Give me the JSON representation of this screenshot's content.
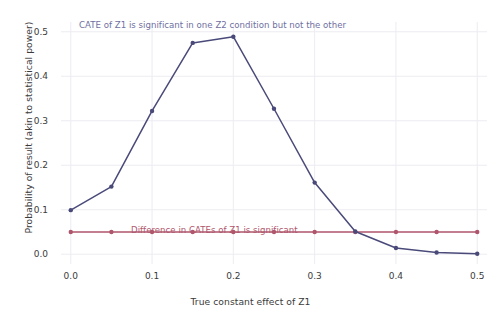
{
  "chart_data": {
    "type": "line",
    "title": "",
    "subtitle": "",
    "xlabel": "True constant effect of Z1",
    "ylabel": "Probability of result (akin to statistical power)",
    "xlim": [
      -0.012,
      0.512
    ],
    "ylim": [
      -0.022,
      0.522
    ],
    "grid": true,
    "legend": "none (inline annotations)",
    "x": [
      0.0,
      0.05,
      0.1,
      0.15,
      0.2,
      0.25,
      0.3,
      0.35,
      0.4,
      0.45,
      0.5
    ],
    "xtick_labels": [
      "0.0",
      "0.1",
      "0.2",
      "0.3",
      "0.4",
      "0.5"
    ],
    "xtick_values": [
      0.0,
      0.1,
      0.2,
      0.3,
      0.4,
      0.5
    ],
    "ytick_labels": [
      "0.0",
      "0.1",
      "0.2",
      "0.3",
      "0.4",
      "0.5"
    ],
    "ytick_values": [
      0.0,
      0.1,
      0.2,
      0.3,
      0.4,
      0.5
    ],
    "series": [
      {
        "name": "CATE of Z1 is significant in one Z2 condition but not the other",
        "color": "#4a4a7a",
        "marker": "circle",
        "values": [
          0.099,
          0.152,
          0.322,
          0.475,
          0.489,
          0.327,
          0.161,
          0.051,
          0.014,
          0.004,
          0.001
        ]
      },
      {
        "name": "Difference in CATEs of Z1 is significant",
        "color": "#b0566c",
        "marker": "circle",
        "values": [
          0.05,
          0.05,
          0.05,
          0.05,
          0.05,
          0.05,
          0.05,
          0.05,
          0.05,
          0.05,
          0.05
        ]
      }
    ],
    "annotations": [
      {
        "id": "annotation-blue",
        "text": "CATE of Z1 is significant in one Z2 condition but not the other",
        "color": "#6f6f9f"
      },
      {
        "id": "annotation-red",
        "text": "Difference in CATEs of Z1 is significant",
        "color": "#b0566c"
      }
    ]
  },
  "axes": {
    "x_title": "True constant effect of Z1",
    "y_title": "Probability of result (akin to statistical power)",
    "x_ticks": [
      "0.0",
      "0.1",
      "0.2",
      "0.3",
      "0.4",
      "0.5"
    ],
    "y_ticks": [
      "0.0",
      "0.1",
      "0.2",
      "0.3",
      "0.4",
      "0.5"
    ]
  },
  "annotations": {
    "blue_text": "CATE of Z1 is significant in one Z2 condition but not the other",
    "red_text": "Difference in CATEs of Z1 is significant"
  },
  "colors": {
    "series_blue": "#4a4a7a",
    "series_red": "#b0566c",
    "annotation_blue": "#6f6f9f",
    "annotation_red": "#b0566c",
    "grid": "#ececf2",
    "background": "#ffffff",
    "text": "#3b3b3b"
  }
}
